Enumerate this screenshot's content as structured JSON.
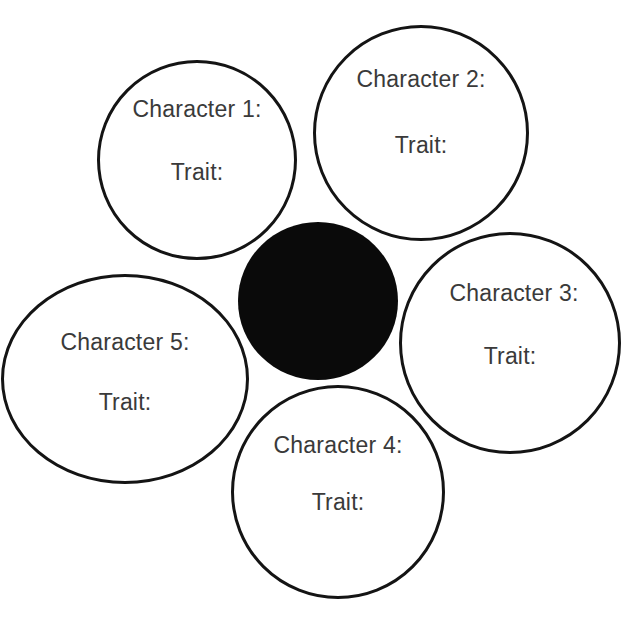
{
  "diagram": {
    "type": "character-trait-flower",
    "center": {
      "fill": "#0a0a0a",
      "cx": 318,
      "cy": 301,
      "r": 80
    },
    "petals": [
      {
        "character_label": "Character 1:",
        "trait_label": "Trait:",
        "cx": 197,
        "cy": 160,
        "r": 100
      },
      {
        "character_label": "Character 2:",
        "trait_label": "Trait:",
        "cx": 421,
        "cy": 133,
        "r": 108
      },
      {
        "character_label": "Character 3:",
        "trait_label": "Trait:",
        "cx": 510,
        "cy": 343,
        "r": 111
      },
      {
        "character_label": "Character 4:",
        "trait_label": "Trait:",
        "cx": 338,
        "cy": 492,
        "r": 107
      },
      {
        "character_label": "Character 5:",
        "trait_label": "Trait:",
        "cx": 125,
        "cy": 379,
        "r": 124
      }
    ],
    "stroke_color": "#141414",
    "text_color": "#3a3a3a"
  }
}
